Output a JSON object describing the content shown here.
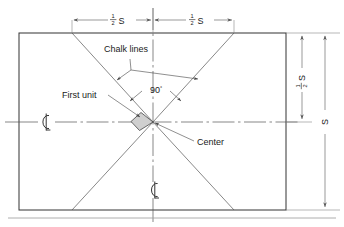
{
  "diagram": {
    "labels": {
      "chalk_lines": "Chalk lines",
      "first_unit": "First unit",
      "center": "Center",
      "angle": "90",
      "degree_symbol": "°",
      "centerline_left": "℄",
      "centerline_bottom": "℄"
    },
    "dimensions": {
      "top_left": {
        "numerator": "1",
        "denominator": "2",
        "unit": "S"
      },
      "top_right": {
        "numerator": "1",
        "denominator": "2",
        "unit": "S"
      },
      "right_inner": {
        "numerator": "1",
        "denominator": "2",
        "unit": "S"
      },
      "right_outer": {
        "unit": "S"
      }
    },
    "colors": {
      "line": "#333333",
      "thin_line": "#555555",
      "unit_fill": "#cfcfcf",
      "background": "#ffffff"
    }
  }
}
